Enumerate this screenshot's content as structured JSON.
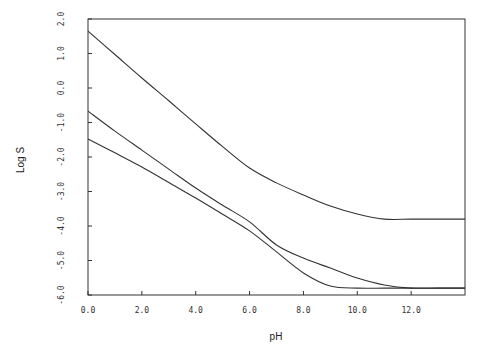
{
  "chart_data": {
    "type": "line",
    "title": "",
    "xlabel": "pH",
    "ylabel": "Log S",
    "xlim": [
      0,
      14
    ],
    "ylim": [
      -6,
      2
    ],
    "grid": false,
    "legend": null,
    "x_ticks": [
      "0.0",
      "2.0",
      "4.0",
      "6.0",
      "8.0",
      "10.0",
      "12.0"
    ],
    "x_tick_values": [
      0,
      2,
      4,
      6,
      8,
      10,
      12
    ],
    "y_ticks": [
      "2.0",
      "1.0",
      "0.0",
      "-1.0",
      "-2.0",
      "-3.0",
      "-4.0",
      "-5.0",
      "-6.0"
    ],
    "y_tick_values": [
      2,
      1,
      0,
      -1,
      -2,
      -3,
      -4,
      -5,
      -6
    ],
    "x": [
      0,
      1,
      2,
      3,
      4,
      5,
      6,
      7,
      8,
      9,
      10,
      11,
      12,
      13,
      14
    ],
    "series": [
      {
        "name": "upper curve",
        "values": [
          1.65,
          0.97,
          0.29,
          -0.37,
          -1.04,
          -1.7,
          -2.32,
          -2.75,
          -3.1,
          -3.42,
          -3.65,
          -3.8,
          -3.8,
          -3.8,
          -3.8
        ]
      },
      {
        "name": "middle curve",
        "values": [
          -0.67,
          -1.25,
          -1.8,
          -2.35,
          -2.9,
          -3.4,
          -3.88,
          -4.55,
          -4.93,
          -5.22,
          -5.51,
          -5.71,
          -5.8,
          -5.8,
          -5.8
        ]
      },
      {
        "name": "lower curve",
        "values": [
          -1.48,
          -1.88,
          -2.29,
          -2.74,
          -3.19,
          -3.66,
          -4.14,
          -4.75,
          -5.36,
          -5.74,
          -5.8,
          -5.8,
          -5.8,
          -5.8,
          -5.8
        ]
      }
    ]
  },
  "colors": {
    "line": "#333333",
    "axis": "#333333",
    "background": "#ffffff"
  }
}
